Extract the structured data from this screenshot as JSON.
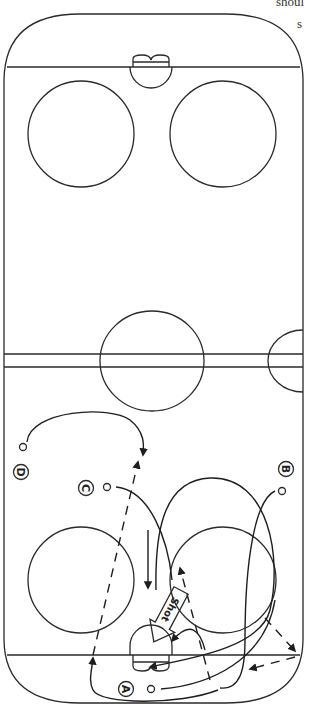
{
  "cut_text": {
    "line1": "shoul",
    "line2": "s"
  },
  "rink": {
    "stroke_color": "#2a2a2a",
    "background": "#ffffff",
    "elements": [
      "boards",
      "goal-lines",
      "goal-creases",
      "nets",
      "faceoff-circles",
      "center-line",
      "center-circle",
      "referee-crease"
    ]
  },
  "players": [
    {
      "id": "A",
      "label": "A"
    },
    {
      "id": "B",
      "label": "B"
    },
    {
      "id": "C",
      "label": "C"
    },
    {
      "id": "D",
      "label": "D"
    }
  ],
  "annotations": {
    "shot_label": "Shot"
  },
  "legend": {
    "solid_arrow": "skating path",
    "dashed_arrow": "pass",
    "block_arrow": "shot"
  }
}
